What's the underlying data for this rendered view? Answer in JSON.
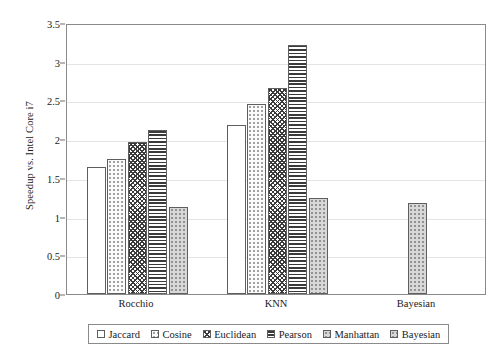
{
  "chart_data": {
    "type": "bar",
    "title": "",
    "xlabel": "",
    "ylabel": "Speedup vs. Intel Core i7",
    "categories": [
      "Rocchio",
      "KNN",
      "Bayesian"
    ],
    "ylim": [
      0,
      3.5
    ],
    "ytick_labels": [
      "0",
      "0.5",
      "1",
      "1.5",
      "2",
      "2.5",
      "3",
      "3.5"
    ],
    "ytick_values": [
      0,
      0.5,
      1,
      1.5,
      2,
      2.5,
      3,
      3.5
    ],
    "grid": "horizontal",
    "legend_position": "bottom",
    "series": [
      {
        "name": "Jaccard",
        "pattern": "open-white",
        "values": [
          1.64,
          2.18,
          null
        ]
      },
      {
        "name": "Cosine",
        "pattern": "light-dotted",
        "values": [
          1.74,
          2.45,
          null
        ]
      },
      {
        "name": "Euclidean",
        "pattern": "dense-crosshatch",
        "values": [
          1.96,
          2.66,
          null
        ]
      },
      {
        "name": "Pearson",
        "pattern": "horizontal-lines",
        "values": [
          2.12,
          3.21,
          null
        ]
      },
      {
        "name": "Manhattan",
        "pattern": "gray-dotted",
        "values": [
          1.12,
          1.24,
          null
        ]
      },
      {
        "name": "Bayesian",
        "pattern": "gray-dotted-light",
        "values": [
          null,
          null,
          1.17
        ]
      }
    ]
  },
  "legend": {
    "items": [
      {
        "label": "Jaccard"
      },
      {
        "label": "Cosine"
      },
      {
        "label": "Euclidean"
      },
      {
        "label": "Pearson"
      },
      {
        "label": "Manhattan"
      },
      {
        "label": "Bayesian"
      }
    ]
  },
  "colors": {
    "frame": "#8a8a8a",
    "grid": "#e4e4e4",
    "bar_outline": "#5e5e5e",
    "text": "#1a1a1a",
    "background": "#ffffff"
  }
}
